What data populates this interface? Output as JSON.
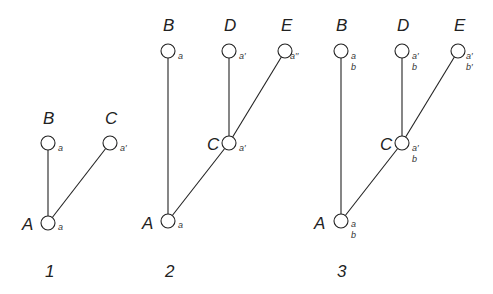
{
  "node_radius": 7,
  "panels": [
    {
      "number": "1",
      "number_pos": [
        45,
        277
      ],
      "nodes": [
        {
          "id": "A",
          "x": 48,
          "y": 223,
          "label": "A",
          "label_pos": [
            22,
            230
          ],
          "subs": [
            "a"
          ],
          "sub_pos": [
            58,
            230
          ]
        },
        {
          "id": "B",
          "x": 48,
          "y": 143,
          "label": "B",
          "label_pos": [
            43,
            124
          ],
          "subs": [
            "a"
          ],
          "sub_pos": [
            58,
            151
          ]
        },
        {
          "id": "C",
          "x": 110,
          "y": 143,
          "label": "C",
          "label_pos": [
            105,
            124
          ],
          "subs": [
            "a′"
          ],
          "sub_pos": [
            120,
            151
          ]
        }
      ],
      "edges": [
        [
          "A",
          "B"
        ],
        [
          "A",
          "C"
        ]
      ]
    },
    {
      "number": "2",
      "number_pos": [
        165,
        277
      ],
      "nodes": [
        {
          "id": "A",
          "x": 168,
          "y": 221,
          "label": "A",
          "label_pos": [
            142,
            229
          ],
          "subs": [
            "a"
          ],
          "sub_pos": [
            178,
            228
          ]
        },
        {
          "id": "B",
          "x": 168,
          "y": 51,
          "label": "B",
          "label_pos": [
            163,
            31
          ],
          "subs": [
            "a"
          ],
          "sub_pos": [
            178,
            59
          ]
        },
        {
          "id": "C",
          "x": 229,
          "y": 143,
          "label": "C",
          "label_pos": [
            207,
            150
          ],
          "subs": [
            "a′"
          ],
          "sub_pos": [
            239,
            151
          ]
        },
        {
          "id": "D",
          "x": 229,
          "y": 51,
          "label": "D",
          "label_pos": [
            224,
            31
          ],
          "subs": [
            "a′"
          ],
          "sub_pos": [
            239,
            59
          ]
        },
        {
          "id": "E",
          "x": 285,
          "y": 51,
          "label": "E",
          "label_pos": [
            281,
            31
          ],
          "subs": [
            "a′′"
          ],
          "sub_pos": [
            290,
            59
          ]
        }
      ],
      "edges": [
        [
          "A",
          "B"
        ],
        [
          "A",
          "C"
        ],
        [
          "C",
          "D"
        ],
        [
          "C",
          "E"
        ]
      ]
    },
    {
      "number": "3",
      "number_pos": [
        337,
        277
      ],
      "nodes": [
        {
          "id": "A",
          "x": 341,
          "y": 221,
          "label": "A",
          "label_pos": [
            314,
            229
          ],
          "subs": [
            "a",
            "b"
          ],
          "sub_pos": [
            351,
            227
          ]
        },
        {
          "id": "B",
          "x": 341,
          "y": 51,
          "label": "B",
          "label_pos": [
            336,
            31
          ],
          "subs": [
            "a",
            "b"
          ],
          "sub_pos": [
            351,
            59
          ]
        },
        {
          "id": "C",
          "x": 402,
          "y": 143,
          "label": "C",
          "label_pos": [
            380,
            150
          ],
          "subs": [
            "a′",
            "b"
          ],
          "sub_pos": [
            412,
            151
          ]
        },
        {
          "id": "D",
          "x": 402,
          "y": 51,
          "label": "D",
          "label_pos": [
            397,
            31
          ],
          "subs": [
            "a′",
            "b"
          ],
          "sub_pos": [
            412,
            59
          ]
        },
        {
          "id": "E",
          "x": 458,
          "y": 51,
          "label": "E",
          "label_pos": [
            454,
            31
          ],
          "subs": [
            "a′",
            "b′"
          ],
          "sub_pos": [
            466,
            59
          ]
        }
      ],
      "edges": [
        [
          "A",
          "B"
        ],
        [
          "A",
          "C"
        ],
        [
          "C",
          "D"
        ],
        [
          "C",
          "E"
        ]
      ]
    }
  ]
}
